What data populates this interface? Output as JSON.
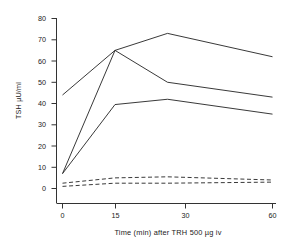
{
  "chart_data": {
    "type": "line",
    "title": "",
    "subtitle": "",
    "xlabel": "Time (min) after TRH 500 µg iv",
    "ylabel": "TSH µU/ml",
    "x": [
      0,
      15,
      30,
      60
    ],
    "xticklabels": [
      "0",
      "15",
      "30",
      "60"
    ],
    "yticks": [
      0,
      10,
      20,
      30,
      40,
      50,
      60,
      70,
      80
    ],
    "yticklabels": [
      "0",
      "10",
      "20",
      "30",
      "40",
      "50",
      "60",
      "70",
      "80"
    ],
    "xlim": [
      0,
      60
    ],
    "ylim": [
      0,
      80
    ],
    "grid": false,
    "legend": "none",
    "annotations": [],
    "series": [
      {
        "name": "solid-1",
        "style": "solid",
        "color": "#222222",
        "values": [
          44,
          65,
          73,
          62
        ]
      },
      {
        "name": "solid-2",
        "style": "solid",
        "color": "#222222",
        "values": [
          7,
          65,
          50,
          43
        ]
      },
      {
        "name": "solid-3",
        "style": "solid",
        "color": "#222222",
        "values": [
          7,
          39.5,
          42,
          35
        ]
      },
      {
        "name": "dashed-1",
        "style": "dashed",
        "color": "#222222",
        "values": [
          2.5,
          5,
          5.5,
          4
        ]
      },
      {
        "name": "dashed-2",
        "style": "dashed",
        "color": "#222222",
        "values": [
          1,
          2.5,
          2.5,
          3
        ]
      }
    ]
  },
  "axes": {
    "y_axis_title": "TSH µU/ml",
    "x_axis_title": "Time (min) after TRH 500 µg iv",
    "y_tick_0": "0",
    "y_tick_10": "10",
    "y_tick_20": "20",
    "y_tick_30": "30",
    "y_tick_40": "40",
    "y_tick_50": "50",
    "y_tick_60": "60",
    "y_tick_70": "70",
    "y_tick_80": "80",
    "x_tick_0": "0",
    "x_tick_15": "15",
    "x_tick_30": "30",
    "x_tick_60": "60"
  },
  "style": {
    "line_color": "#222222",
    "axis_color": "#333333",
    "background": "#ffffff"
  }
}
